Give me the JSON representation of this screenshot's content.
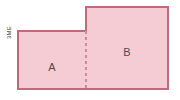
{
  "figure": {
    "type": "composite-rectangle-diagram",
    "background_color": "#ffffff",
    "fill_color": "#f6ccd4",
    "stroke_color": "#c4687e",
    "divider_color": "#c98ca0",
    "label_color": "#4a4a52",
    "regions": [
      {
        "id": "A",
        "label": "A",
        "label_x": 52,
        "label_y": 67,
        "x": 18,
        "y": 31,
        "width": 68,
        "height": 58
      },
      {
        "id": "B",
        "label": "B",
        "label_x": 127,
        "label_y": 52,
        "x": 86,
        "y": 7,
        "width": 82,
        "height": 82
      }
    ],
    "divider": {
      "name": "dashed-divider",
      "x": 86,
      "y1": 31,
      "y2": 89,
      "dash": "3 3"
    },
    "outline_points": "18,31 86,31 86,7 168,7 168,89 18,89",
    "dimension_label": "3ME"
  }
}
